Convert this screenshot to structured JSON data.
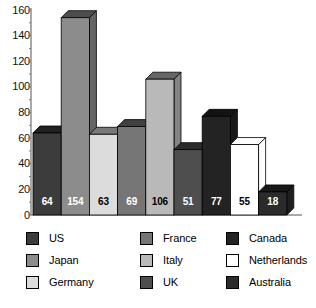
{
  "chart_data": {
    "type": "bar",
    "title": "",
    "subtitle": "",
    "xlabel": "",
    "ylabel": "",
    "ylim": [
      0,
      160
    ],
    "y_major_step": 20,
    "y_minor_step": 10,
    "grid": false,
    "legend_position": "bottom",
    "style": "3d-column",
    "categories": [
      "US",
      "Japan",
      "Germany",
      "France",
      "Italy",
      "UK",
      "Canada",
      "Netherlands",
      "Australia"
    ],
    "values": [
      64,
      154,
      63,
      69,
      106,
      51,
      77,
      55,
      18
    ],
    "data_labels": [
      "64",
      "154",
      "63",
      "69",
      "106",
      "51",
      "77",
      "55",
      "18"
    ],
    "y_tick_labels": [
      "160",
      "140",
      "120",
      "100",
      "80",
      "60",
      "40",
      "20",
      "0"
    ],
    "y_tick_values": [
      160,
      140,
      120,
      100,
      80,
      60,
      40,
      20,
      0
    ],
    "series_colors": {
      "US": "#3c3c3c",
      "Japan": "#8c8c8c",
      "Germany": "#dcdcdc",
      "France": "#767676",
      "Italy": "#b9b9b9",
      "UK": "#4e4e4e",
      "Canada": "#232323",
      "Netherlands": "#ffffff",
      "Australia": "#2b2b2b"
    },
    "data_label_colors": {
      "US": "#ffffff",
      "Japan": "#ffffff",
      "Germany": "#000000",
      "France": "#ffffff",
      "Italy": "#000000",
      "UK": "#ffffff",
      "Canada": "#ffffff",
      "Netherlands": "#000000",
      "Australia": "#ffffff"
    }
  },
  "legend": {
    "columns": [
      {
        "items": [
          {
            "label": "US",
            "color": "#3c3c3c"
          },
          {
            "label": "Japan",
            "color": "#8c8c8c"
          },
          {
            "label": "Germany",
            "color": "#dcdcdc"
          }
        ]
      },
      {
        "items": [
          {
            "label": "France",
            "color": "#767676"
          },
          {
            "label": "Italy",
            "color": "#b9b9b9"
          },
          {
            "label": "UK",
            "color": "#4e4e4e"
          }
        ]
      },
      {
        "items": [
          {
            "label": "Canada",
            "color": "#232323"
          },
          {
            "label": "Netherlands",
            "color": "#ffffff"
          },
          {
            "label": "Australia",
            "color": "#2b2b2b"
          }
        ]
      }
    ]
  },
  "axis": {
    "line_color": "#555555",
    "tick_color": "#777777"
  }
}
